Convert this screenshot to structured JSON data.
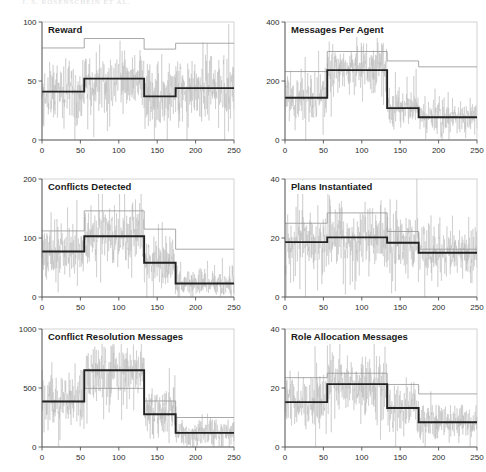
{
  "figure": {
    "header_text": "J. S. ROSENSCHEIN ET AL.",
    "width": 486,
    "height": 472,
    "background": "#ffffff",
    "colors": {
      "noise": "#b9b9b9",
      "thin_step": "#9a9a9a",
      "thick_step": "#222222",
      "frame": "#c8c8c8",
      "axis": "#555555",
      "text": "#1a1a1a"
    },
    "panel_layout": {
      "columns": 2,
      "rows": 3,
      "panel_width": 243,
      "panel_height": 157
    }
  },
  "chart_data": [
    {
      "id": "reward",
      "type": "line",
      "title": "Reward",
      "xlabel": "",
      "ylabel": "",
      "xlim": [
        0,
        250
      ],
      "ylim": [
        0,
        100
      ],
      "xticks": [
        0,
        50,
        100,
        150,
        200,
        250
      ],
      "yticks": [
        0,
        50,
        100
      ],
      "grid": false,
      "legend": "none",
      "series": [
        {
          "name": "mean",
          "style": "thick-step",
          "breakpoints": [
            0,
            55,
            133,
            174,
            250
          ],
          "values": [
            41,
            52,
            37,
            44
          ]
        },
        {
          "name": "upper-bound",
          "style": "thin-step",
          "breakpoints": [
            0,
            55,
            133,
            174,
            250
          ],
          "values": [
            78,
            86,
            77,
            82
          ]
        },
        {
          "name": "noise",
          "style": "noise-trace",
          "breakpoints": [
            0,
            55,
            133,
            174,
            250
          ],
          "values": [
            41,
            52,
            37,
            44
          ],
          "spread": [
            26,
            24,
            28,
            26
          ],
          "floor": 0,
          "ceil": 100
        }
      ]
    },
    {
      "id": "messages-per-agent",
      "type": "line",
      "title": "Messages Per Agent",
      "xlabel": "",
      "ylabel": "",
      "xlim": [
        0,
        250
      ],
      "ylim": [
        0,
        400
      ],
      "xticks": [
        0,
        50,
        100,
        150,
        200,
        250
      ],
      "yticks": [
        0,
        200,
        400
      ],
      "grid": false,
      "legend": "none",
      "series": [
        {
          "name": "mean",
          "style": "thick-step",
          "breakpoints": [
            0,
            55,
            133,
            174,
            250
          ],
          "values": [
            143,
            237,
            108,
            77
          ]
        },
        {
          "name": "upper-bound",
          "style": "thin-step",
          "breakpoints": [
            0,
            55,
            133,
            174,
            250
          ],
          "values": [
            232,
            300,
            268,
            248
          ]
        },
        {
          "name": "noise",
          "style": "noise-trace",
          "breakpoints": [
            0,
            55,
            133,
            174,
            250
          ],
          "values": [
            143,
            237,
            108,
            77
          ],
          "spread": [
            80,
            80,
            72,
            50
          ],
          "floor": 0,
          "ceil": 400
        }
      ]
    },
    {
      "id": "conflicts-detected",
      "type": "line",
      "title": "Conflicts Detected",
      "xlabel": "",
      "ylabel": "",
      "xlim": [
        0,
        250
      ],
      "ylim": [
        0,
        200
      ],
      "xticks": [
        0,
        50,
        100,
        150,
        200,
        250
      ],
      "yticks": [
        0,
        100,
        200
      ],
      "grid": false,
      "legend": "none",
      "series": [
        {
          "name": "mean",
          "style": "thick-step",
          "breakpoints": [
            0,
            55,
            133,
            174,
            250
          ],
          "values": [
            77,
            103,
            58,
            23
          ]
        },
        {
          "name": "upper-bound",
          "style": "thin-step",
          "breakpoints": [
            0,
            55,
            133,
            174,
            250
          ],
          "values": [
            112,
            146,
            115,
            81
          ]
        },
        {
          "name": "noise",
          "style": "noise-trace",
          "breakpoints": [
            0,
            55,
            133,
            174,
            250
          ],
          "values": [
            77,
            103,
            58,
            23
          ],
          "spread": [
            45,
            46,
            44,
            22
          ],
          "floor": 0,
          "ceil": 200
        }
      ]
    },
    {
      "id": "plans-instantiated",
      "type": "line",
      "title": "Plans Instantiated",
      "xlabel": "",
      "ylabel": "",
      "xlim": [
        0,
        250
      ],
      "ylim": [
        0,
        40
      ],
      "xticks": [
        0,
        50,
        100,
        150,
        200,
        250
      ],
      "yticks": [
        0,
        20,
        40
      ],
      "grid": false,
      "legend": "none",
      "series": [
        {
          "name": "mean",
          "style": "thick-step",
          "breakpoints": [
            0,
            55,
            133,
            174,
            250
          ],
          "values": [
            18.6,
            20.2,
            18.4,
            15.0
          ]
        },
        {
          "name": "upper-bound",
          "style": "thin-step",
          "breakpoints": [
            0,
            55,
            133,
            174,
            250
          ],
          "values": [
            25.0,
            28.5,
            22.2,
            16.2
          ]
        },
        {
          "name": "noise",
          "style": "noise-trace",
          "breakpoints": [
            0,
            55,
            133,
            174,
            250
          ],
          "values": [
            18.6,
            20.2,
            18.4,
            15.0
          ],
          "spread": [
            11,
            10,
            11,
            8
          ],
          "floor": 0,
          "ceil": 40
        }
      ]
    },
    {
      "id": "conflict-resolution-messages",
      "type": "line",
      "title": "Conflict Resolution Messages",
      "xlabel": "",
      "ylabel": "",
      "xlim": [
        0,
        250
      ],
      "ylim": [
        0,
        1000
      ],
      "xticks": [
        0,
        50,
        100,
        150,
        200,
        250
      ],
      "yticks": [
        0,
        500,
        1000
      ],
      "grid": false,
      "legend": "none",
      "series": [
        {
          "name": "mean",
          "style": "thick-step",
          "breakpoints": [
            0,
            55,
            133,
            174,
            250
          ],
          "values": [
            386,
            650,
            277,
            120
          ]
        },
        {
          "name": "upper-bound",
          "style": "thin-step",
          "breakpoints": [
            0,
            55,
            133,
            174,
            250
          ],
          "values": [
            388,
            497,
            390,
            250
          ]
        },
        {
          "name": "noise",
          "style": "noise-trace",
          "breakpoints": [
            0,
            55,
            133,
            174,
            250
          ],
          "values": [
            386,
            650,
            277,
            120
          ],
          "spread": [
            230,
            240,
            210,
            110
          ],
          "floor": 0,
          "ceil": 1000
        }
      ]
    },
    {
      "id": "role-allocation-messages",
      "type": "line",
      "title": "Role Allocation Messages",
      "xlabel": "",
      "ylabel": "",
      "xlim": [
        0,
        250
      ],
      "ylim": [
        0,
        40
      ],
      "xticks": [
        0,
        50,
        100,
        150,
        200,
        250
      ],
      "yticks": [
        0,
        20,
        40
      ],
      "grid": false,
      "legend": "none",
      "series": [
        {
          "name": "mean",
          "style": "thick-step",
          "breakpoints": [
            0,
            55,
            133,
            174,
            250
          ],
          "values": [
            15.2,
            21.3,
            13.2,
            8.4
          ]
        },
        {
          "name": "upper-bound",
          "style": "thin-step",
          "breakpoints": [
            0,
            55,
            133,
            174,
            250
          ],
          "values": [
            23.5,
            25.0,
            21.2,
            18.0
          ]
        },
        {
          "name": "noise",
          "style": "noise-trace",
          "breakpoints": [
            0,
            55,
            133,
            174,
            250
          ],
          "values": [
            15.2,
            21.3,
            13.2,
            8.4
          ],
          "spread": [
            9.5,
            9.5,
            8.5,
            5.5
          ],
          "floor": 0,
          "ceil": 40
        }
      ]
    }
  ]
}
